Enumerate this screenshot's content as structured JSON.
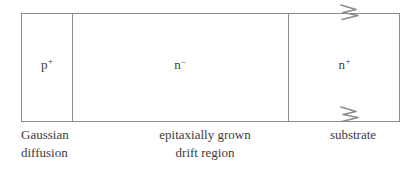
{
  "diagram": {
    "line_color": "#8c8c8c",
    "text_color": "#3b3b3b",
    "background_color": "#ffffff",
    "regions": [
      {
        "id": "p-plus-region",
        "label_base": "p",
        "label_superscript": "+",
        "label_full": "p⁺",
        "caption_line1": "Gaussian",
        "caption_line2": "diffusion",
        "caption_align": "left"
      },
      {
        "id": "n-minus-region",
        "label_base": "n",
        "label_superscript": "–",
        "label_full": "n⁻",
        "caption_line1": "epitaxially grown",
        "caption_line2": "drift region",
        "caption_align": "center"
      },
      {
        "id": "n-plus-region",
        "label_base": "n",
        "label_superscript": "+",
        "label_full": "n⁺",
        "caption_line1": "",
        "caption_line2": "substrate",
        "caption_align": "center"
      }
    ],
    "break_symbols": [
      {
        "id": "break-symbol-top",
        "position": "top",
        "icon": "zigzag-break-icon"
      },
      {
        "id": "break-symbol-bottom",
        "position": "bottom",
        "icon": "zigzag-break-icon"
      }
    ]
  }
}
